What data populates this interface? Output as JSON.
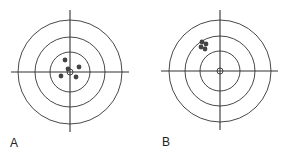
{
  "figure": {
    "panels": [
      {
        "label": "A",
        "description": "Target with shots tightly grouped around the center",
        "center": [
          70,
          72
        ],
        "ring_radii": [
          52,
          35,
          20,
          3
        ],
        "hline": [
          11,
          129
        ],
        "vline": [
          10,
          132
        ],
        "shots": [
          [
            65,
            60
          ],
          [
            68,
            69
          ],
          [
            79,
            67
          ],
          [
            61,
            76
          ],
          [
            76,
            77
          ]
        ]
      },
      {
        "label": "B",
        "description": "Target with shots tightly grouped but off-center (upper left)",
        "center": [
          220,
          71
        ],
        "ring_radii": [
          51,
          35,
          20,
          3
        ],
        "hline": [
          161,
          278
        ],
        "vline": [
          10,
          130
        ],
        "shots": [
          [
            202,
            42
          ],
          [
            206,
            44
          ],
          [
            201,
            47
          ],
          [
            205,
            49
          ]
        ]
      }
    ],
    "colors": {
      "lines": "#333333",
      "shots": "#444444"
    }
  }
}
